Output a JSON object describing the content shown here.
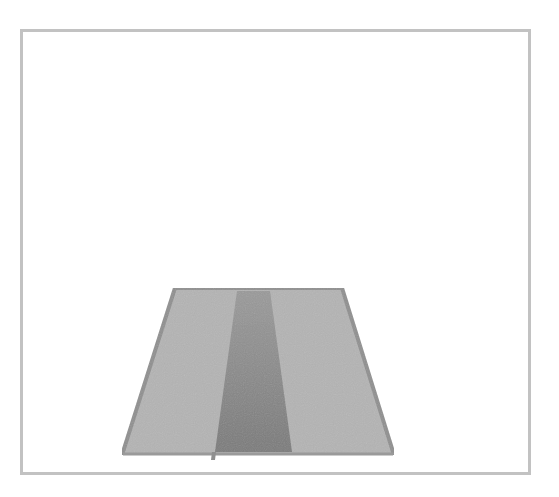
{
  "image": {
    "description": "Grayscale illustration of a trapezoid road surface inside a rectangular frame",
    "colors": {
      "background": "#ffffff",
      "frame_border": "#c2c2c2",
      "road_fill": "#b4b4b4",
      "road_edge": "#8f8f8f",
      "center_strip": "#8a8a8a",
      "center_strip_bottom": "#7a7a7a"
    },
    "shapes": {
      "frame": {
        "x": 20,
        "y": 29,
        "width": 511,
        "height": 446
      },
      "road_trapezoid": {
        "points": [
          [
            175,
            288
          ],
          [
            342,
            288
          ],
          [
            394,
            455
          ],
          [
            122,
            455
          ]
        ]
      },
      "center_strip": {
        "points": [
          [
            237,
            290
          ],
          [
            270,
            290
          ],
          [
            292,
            452
          ],
          [
            215,
            452
          ]
        ]
      }
    }
  }
}
